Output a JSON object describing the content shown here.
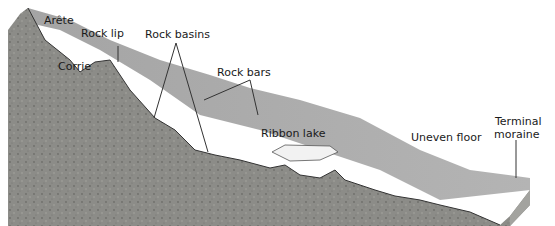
{
  "diagram": {
    "labels": {
      "arete": "Arête",
      "rock_lip": "Rock lip",
      "corrie": "Corrie",
      "rock_basins": "Rock basins",
      "rock_bars": "Rock bars",
      "ribbon_lake": "Ribbon lake",
      "uneven_floor": "Uneven floor",
      "terminal_moraine_1": "Terminal",
      "terminal_moraine_2": "moraine"
    },
    "colors": {
      "surface": "#a9a9a9",
      "rock": "#8a8a86",
      "lake": "#f2f2f2",
      "outline": "#333333"
    }
  }
}
